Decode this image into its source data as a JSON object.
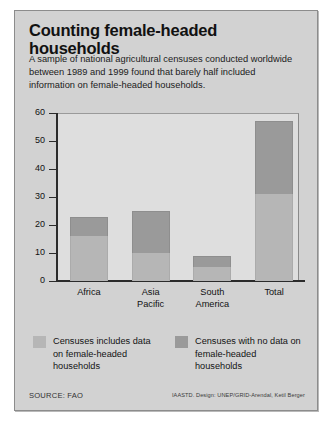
{
  "header": {
    "title": "Counting female-headed households",
    "subtitle": "A sample of national agricultural censuses conducted worldwide between 1989 and 1999 found that barely half included information on female-headed households."
  },
  "legend": {
    "items": [
      {
        "label": "Censuses includes data on female-headed households",
        "color": "#b6b6b6",
        "swatch_name": "legend-swatch-included"
      },
      {
        "label": "Censuses with no data on female-headed households",
        "color": "#9a9a9a",
        "swatch_name": "legend-swatch-no-data"
      }
    ]
  },
  "footer": {
    "source": "SOURCE: FAO",
    "credit": "IAASTD. Design: UNEP/GRID-Arendal, Ketil Berger"
  },
  "chart_data": {
    "type": "bar",
    "subtype": "stacked-bar",
    "title": "Counting female-headed households",
    "subtitle": "A sample of national agricultural censuses conducted worldwide between 1989 and 1999 found that barely half included information on female-headed households.",
    "categories": [
      "Africa",
      "Asia Pacific",
      "South America",
      "Total"
    ],
    "category_lines": [
      [
        "Africa"
      ],
      [
        "Asia",
        "Pacific"
      ],
      [
        "South",
        "America"
      ],
      [
        "Total"
      ]
    ],
    "series": [
      {
        "name": "Censuses includes data on female-headed households",
        "color": "#b6b6b6",
        "values": [
          16,
          10,
          5,
          31
        ]
      },
      {
        "name": "Censuses with no data on female-headed households",
        "color": "#9a9a9a",
        "values": [
          7,
          15,
          4,
          26
        ]
      }
    ],
    "totals": [
      23,
      25,
      9,
      57
    ],
    "xlabel": "",
    "ylabel": "",
    "ylim": [
      0,
      60
    ],
    "yticks": [
      0,
      10,
      20,
      30,
      40,
      50,
      60
    ],
    "ytick_labels": [
      "0",
      "10",
      "20",
      "30",
      "40",
      "50",
      "60"
    ],
    "grid": false,
    "legend_position": "below-plot",
    "plot_background": "#dedede",
    "panel_background": "#d2d2d2"
  }
}
